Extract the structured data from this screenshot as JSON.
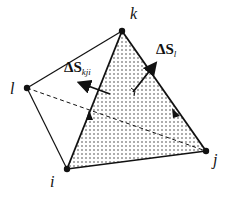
{
  "diagram": {
    "type": "tetrahedron",
    "vertices": [
      {
        "id": "k",
        "label": "k",
        "x": 122,
        "y": 31
      },
      {
        "id": "l",
        "label": "l",
        "x": 27,
        "y": 88
      },
      {
        "id": "i",
        "label": "i",
        "x": 67,
        "y": 169
      },
      {
        "id": "j",
        "label": "j",
        "x": 206,
        "y": 151
      }
    ],
    "shaded_face": [
      "i",
      "j",
      "k"
    ],
    "hidden_edge": [
      "l",
      "j"
    ],
    "vectors": [
      {
        "name": "dS_kji",
        "prefix": "ΔS",
        "subscript": "kji"
      },
      {
        "name": "dS_l",
        "prefix": "ΔS",
        "subscript": "l"
      }
    ],
    "colors": {
      "line": "#111111",
      "dots": "#444444"
    }
  }
}
